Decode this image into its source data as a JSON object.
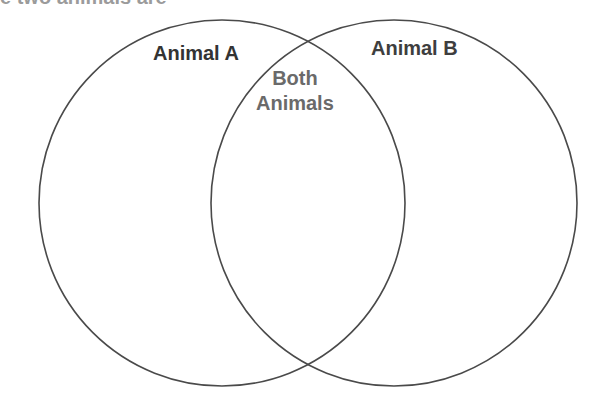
{
  "title_clipped": "e two animals are",
  "diagram": {
    "type": "venn",
    "circles": [
      {
        "name": "Animal A",
        "cx": 222,
        "cy": 203,
        "r": 183
      },
      {
        "name": "Animal B",
        "cx": 394,
        "cy": 203,
        "r": 183
      }
    ],
    "labels": {
      "animal_a": "Animal A",
      "animal_b": "Animal B",
      "both_line1": "Both",
      "both_line2": "Animals"
    },
    "stroke_color": "#4a4a4a"
  }
}
